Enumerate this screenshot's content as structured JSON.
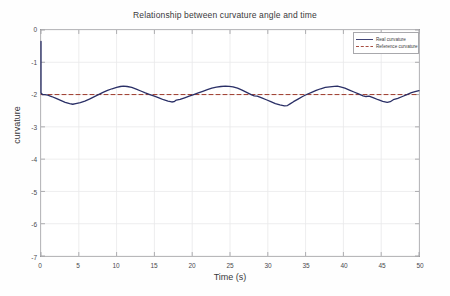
{
  "chart_data": {
    "type": "line",
    "title": "Relationship between curvature angle and time",
    "xlabel": "Time (s)",
    "ylabel": "curvature",
    "xlim": [
      0,
      50
    ],
    "ylim": [
      -7,
      0
    ],
    "xticks": [
      0,
      5,
      10,
      15,
      20,
      25,
      30,
      35,
      40,
      45,
      50
    ],
    "xtick_labels": [
      "0",
      "5",
      "10",
      "15",
      "20",
      "25",
      "30",
      "35",
      "40",
      "45",
      "50"
    ],
    "yticks": [
      0,
      -1,
      -2,
      -3,
      -4,
      -5,
      -6,
      -7
    ],
    "ytick_labels": [
      "0",
      "-1",
      "-2",
      "-3",
      "-4",
      "-5",
      "-6",
      "-7"
    ],
    "grid": true,
    "legend_position": "upper right",
    "series": [
      {
        "name": "Real curvature",
        "color": "#2a2f66",
        "style": "solid",
        "x": [
          0,
          0,
          0.2,
          0.5,
          0.9,
          1.4,
          2.0,
          2.6,
          3.2,
          3.8,
          4.2,
          4.6,
          5.2,
          5.8,
          6.4,
          7.0,
          7.6,
          8.2,
          8.8,
          9.4,
          10.0,
          10.5,
          10.9,
          11.4,
          12.0,
          12.6,
          13.2,
          13.8,
          14.4,
          15.0,
          15.6,
          16.2,
          16.8,
          17.3,
          17.6,
          17.9,
          18.4,
          19.0,
          19.6,
          20.2,
          20.8,
          21.4,
          22.0,
          22.6,
          23.2,
          23.8,
          24.4,
          24.9,
          25.4,
          26.0,
          26.6,
          27.2,
          27.8,
          28.2,
          28.6,
          29.2,
          29.8,
          30.4,
          31.0,
          31.6,
          32.2,
          32.6,
          33.0,
          33.4,
          34.0,
          34.6,
          35.2,
          35.8,
          36.4,
          37.0,
          37.6,
          38.2,
          38.8,
          39.2,
          39.6,
          40.2,
          40.8,
          41.4,
          42.0,
          42.6,
          43.0,
          43.4,
          44.0,
          44.6,
          45.2,
          45.8,
          46.2,
          46.6,
          47.2,
          47.8,
          48.4,
          49.0,
          49.6,
          50.0
        ],
        "y": [
          -0.35,
          -1.95,
          -2.0,
          -2.0,
          -2.02,
          -2.06,
          -2.12,
          -2.18,
          -2.24,
          -2.28,
          -2.3,
          -2.28,
          -2.25,
          -2.2,
          -2.14,
          -2.07,
          -2.0,
          -1.93,
          -1.87,
          -1.82,
          -1.78,
          -1.75,
          -1.74,
          -1.75,
          -1.78,
          -1.83,
          -1.89,
          -1.95,
          -2.0,
          -2.05,
          -2.1,
          -2.16,
          -2.2,
          -2.23,
          -2.22,
          -2.17,
          -2.15,
          -2.1,
          -2.05,
          -2.0,
          -1.95,
          -1.9,
          -1.85,
          -1.8,
          -1.77,
          -1.75,
          -1.74,
          -1.745,
          -1.76,
          -1.8,
          -1.86,
          -1.93,
          -2.0,
          -2.04,
          -2.05,
          -2.1,
          -2.16,
          -2.22,
          -2.28,
          -2.32,
          -2.35,
          -2.34,
          -2.28,
          -2.22,
          -2.14,
          -2.06,
          -1.99,
          -1.93,
          -1.87,
          -1.82,
          -1.78,
          -1.76,
          -1.745,
          -1.74,
          -1.76,
          -1.8,
          -1.86,
          -1.92,
          -1.98,
          -2.04,
          -2.06,
          -2.05,
          -2.1,
          -2.16,
          -2.21,
          -2.24,
          -2.22,
          -2.16,
          -2.12,
          -2.06,
          -2.0,
          -1.94,
          -1.9,
          -1.88
        ]
      },
      {
        "name": "Reference curvature",
        "color": "#9e3b2c",
        "style": "dashed",
        "x": [
          0,
          50
        ],
        "y": [
          -2,
          -2
        ]
      }
    ]
  },
  "legend": {
    "items": [
      {
        "label": "Real curvature",
        "swatch": "solid-line-swatch"
      },
      {
        "label": "Reference curvature",
        "swatch": "dashed-line-swatch"
      }
    ]
  },
  "colors": {
    "real_curve": "#2a2f66",
    "reference_curve": "#9e3b2c",
    "grid": "#e8e8ea",
    "axis": "#9a9a9e",
    "background": "#ffffff"
  }
}
